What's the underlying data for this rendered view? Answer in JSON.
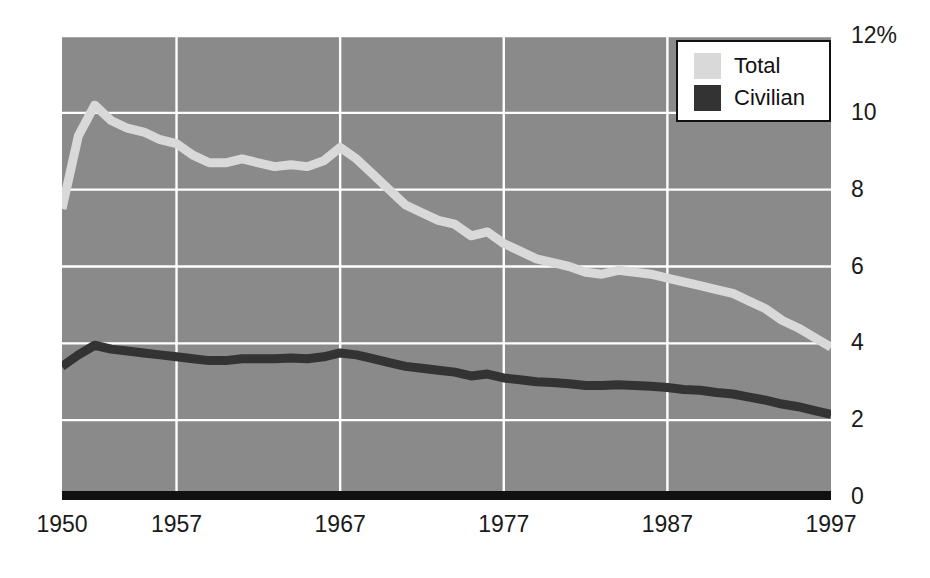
{
  "chart_data": {
    "type": "line",
    "title": "",
    "subtitle": "",
    "xlabel": "",
    "ylabel": "",
    "xlim": [
      1950,
      1997
    ],
    "ylim": [
      0,
      12
    ],
    "grid": true,
    "legend_position": "top-right",
    "plot_background": "#8a8a8a",
    "gridline_color": "#ffffff",
    "axis_line_color": "#111111",
    "y_ticks": [
      0,
      2,
      4,
      6,
      8,
      10,
      12
    ],
    "y_tick_labels": [
      "0",
      "2",
      "4",
      "6",
      "8",
      "10",
      "12%"
    ],
    "x_ticks": [
      1950,
      1957,
      1967,
      1977,
      1987,
      1997
    ],
    "x_tick_labels": [
      "1950",
      "1957",
      "1967",
      "1977",
      "1987",
      "1997"
    ],
    "x": [
      1950,
      1951,
      1952,
      1953,
      1954,
      1955,
      1956,
      1957,
      1958,
      1959,
      1960,
      1961,
      1962,
      1963,
      1964,
      1965,
      1966,
      1967,
      1968,
      1969,
      1970,
      1971,
      1972,
      1973,
      1974,
      1975,
      1976,
      1977,
      1978,
      1979,
      1980,
      1981,
      1982,
      1983,
      1984,
      1985,
      1986,
      1987,
      1988,
      1989,
      1990,
      1991,
      1992,
      1993,
      1994,
      1995,
      1996,
      1997
    ],
    "series": [
      {
        "name": "Total",
        "color": "#d9d9d9",
        "values": [
          7.5,
          9.4,
          10.2,
          9.8,
          9.6,
          9.5,
          9.3,
          9.2,
          8.9,
          8.7,
          8.7,
          8.8,
          8.7,
          8.6,
          8.65,
          8.6,
          8.75,
          9.1,
          8.8,
          8.4,
          8.0,
          7.6,
          7.4,
          7.2,
          7.1,
          6.8,
          6.9,
          6.6,
          6.4,
          6.2,
          6.1,
          6.0,
          5.85,
          5.8,
          5.9,
          5.85,
          5.8,
          5.7,
          5.6,
          5.5,
          5.4,
          5.3,
          5.1,
          4.9,
          4.6,
          4.4,
          4.15,
          3.9
        ]
      },
      {
        "name": "Civilian",
        "color": "#333333",
        "values": [
          3.4,
          3.7,
          3.95,
          3.85,
          3.8,
          3.75,
          3.7,
          3.65,
          3.6,
          3.55,
          3.55,
          3.6,
          3.6,
          3.6,
          3.62,
          3.6,
          3.65,
          3.75,
          3.7,
          3.6,
          3.5,
          3.4,
          3.35,
          3.3,
          3.25,
          3.15,
          3.2,
          3.1,
          3.05,
          3.0,
          2.98,
          2.95,
          2.9,
          2.9,
          2.92,
          2.9,
          2.88,
          2.85,
          2.8,
          2.78,
          2.72,
          2.68,
          2.6,
          2.52,
          2.42,
          2.35,
          2.25,
          2.15
        ]
      }
    ]
  },
  "legend": {
    "entries": [
      {
        "label": "Total",
        "color": "#d9d9d9"
      },
      {
        "label": "Civilian",
        "color": "#333333"
      }
    ]
  }
}
